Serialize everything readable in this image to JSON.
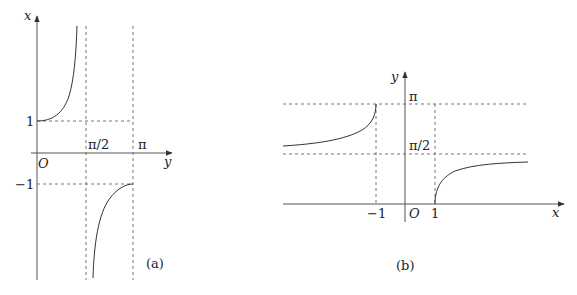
{
  "panel_a": {
    "caption": "(a)",
    "vertical_axis_label": "x",
    "horizontal_axis_label": "y",
    "origin_label": "O",
    "tick_labels": {
      "one": "1",
      "minus_one": "−1",
      "pi_half": "π/2",
      "pi": "π"
    },
    "description": "x = sec y, 0 ≤ y ≤ π, y ≠ π/2"
  },
  "panel_b": {
    "caption": "(b)",
    "vertical_axis_label": "y",
    "horizontal_axis_label": "x",
    "origin_label": "O",
    "tick_labels": {
      "one": "1",
      "minus_one": "−1",
      "pi_half": "π/2",
      "pi": "π"
    },
    "description": "y = arcsec x, |x| ≥ 1"
  },
  "colors": {
    "axis": "#555555",
    "curve": "#333333",
    "dashed": "#666666",
    "background": "#ffffff"
  }
}
